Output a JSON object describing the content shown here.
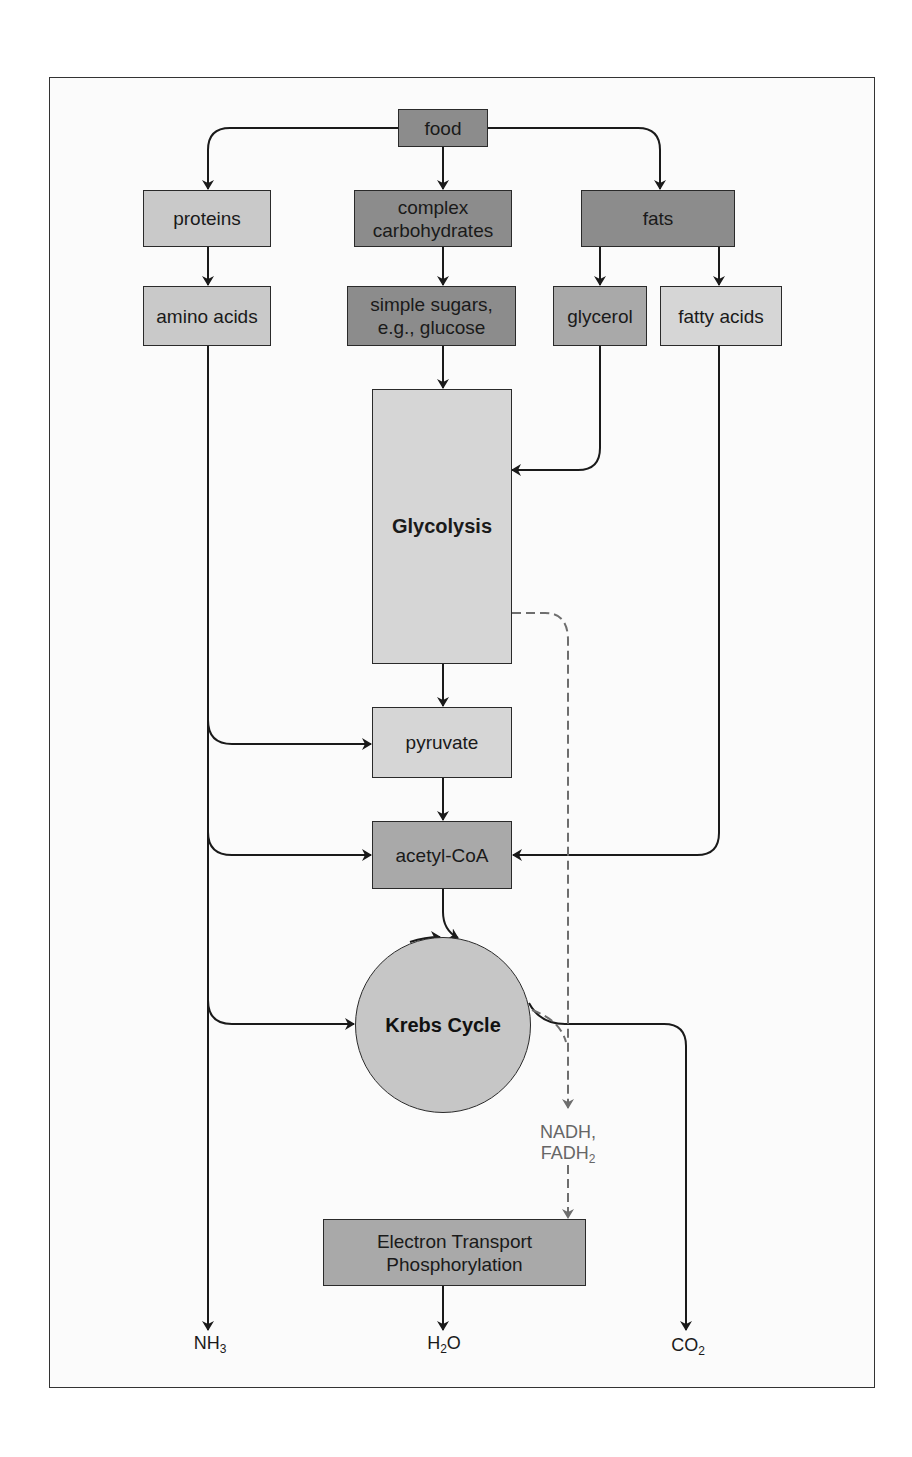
{
  "diagram": {
    "title": "",
    "nodes": {
      "food": "food",
      "proteins": "proteins",
      "complex_carbs_line1": "complex",
      "complex_carbs_line2": "carbohydrates",
      "fats": "fats",
      "amino_acids": "amino acids",
      "simple_sugars_line1": "simple sugars,",
      "simple_sugars_line2": "e.g., glucose",
      "glycerol": "glycerol",
      "fatty_acids": "fatty acids",
      "glycolysis": "Glycolysis",
      "pyruvate": "pyruvate",
      "acetyl_coa": "acetyl-CoA",
      "krebs_cycle": "Krebs Cycle",
      "etp_line1": "Electron Transport",
      "etp_line2": "Phosphorylation"
    },
    "carriers": {
      "nadh": "NADH,",
      "fadh_base": "FADH",
      "fadh_sub": "2"
    },
    "outputs": {
      "nh3_base": "NH",
      "nh3_sub": "3",
      "h2o_h": "H",
      "h2o_sub": "2",
      "h2o_o": "O",
      "co2_base": "CO",
      "co2_sub": "2"
    },
    "edges": [
      {
        "from": "food",
        "to": "proteins"
      },
      {
        "from": "food",
        "to": "complex carbohydrates"
      },
      {
        "from": "food",
        "to": "fats"
      },
      {
        "from": "proteins",
        "to": "amino acids"
      },
      {
        "from": "complex carbohydrates",
        "to": "simple sugars"
      },
      {
        "from": "fats",
        "to": "glycerol"
      },
      {
        "from": "fats",
        "to": "fatty acids"
      },
      {
        "from": "simple sugars",
        "to": "Glycolysis"
      },
      {
        "from": "glycerol",
        "to": "Glycolysis"
      },
      {
        "from": "Glycolysis",
        "to": "pyruvate"
      },
      {
        "from": "amino acids",
        "to": "pyruvate"
      },
      {
        "from": "pyruvate",
        "to": "acetyl-CoA"
      },
      {
        "from": "amino acids",
        "to": "acetyl-CoA"
      },
      {
        "from": "fatty acids",
        "to": "acetyl-CoA"
      },
      {
        "from": "acetyl-CoA",
        "to": "Krebs Cycle"
      },
      {
        "from": "amino acids",
        "to": "Krebs Cycle"
      },
      {
        "from": "amino acids",
        "to": "NH3"
      },
      {
        "from": "Glycolysis",
        "to": "NADH, FADH2",
        "style": "dashed"
      },
      {
        "from": "Krebs Cycle",
        "to": "NADH, FADH2",
        "style": "dashed"
      },
      {
        "from": "NADH, FADH2",
        "to": "Electron Transport Phosphorylation",
        "style": "dashed"
      },
      {
        "from": "Krebs Cycle",
        "to": "CO2"
      },
      {
        "from": "Electron Transport Phosphorylation",
        "to": "H2O"
      }
    ],
    "colors": {
      "dark_box": "#8c8c8c",
      "light_box": "#c9c9c9",
      "glycolysis_box": "#d6d6d6",
      "line": "#1a1a1a",
      "dashed_line": "#6e6e6e"
    }
  }
}
